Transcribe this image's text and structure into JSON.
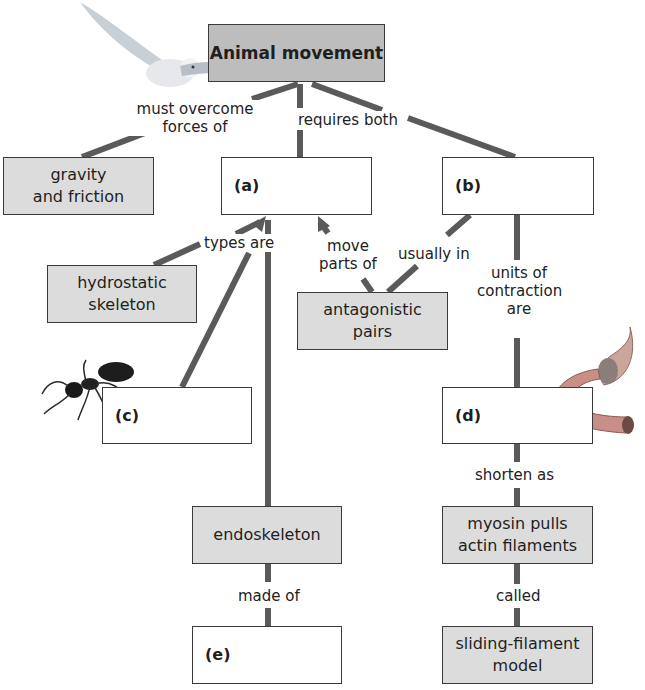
{
  "title": "Animal movement",
  "nodes": {
    "root": "Animal movement",
    "gravity": "gravity and friction",
    "a": "(a)",
    "b": "(b)",
    "hydrostatic": "hydrostatic skeleton",
    "antagonistic": "antagonistic pairs",
    "c": "(c)",
    "d": "(d)",
    "endoskeleton": "endoskeleton",
    "myosin": "myosin pulls actin filaments",
    "e": "(e)",
    "sliding": "sliding-filament model"
  },
  "links": {
    "must_overcome_1": "must overcome",
    "must_overcome_2": "forces of",
    "requires_both": "requires both",
    "types_are": "types are",
    "move_parts_1": "move",
    "move_parts_2": "parts of",
    "usually_in": "usually in",
    "units_1": "units of",
    "units_2": "contraction",
    "units_3": "are",
    "shorten_as": "shorten as",
    "made_of": "made of",
    "called": "called"
  },
  "node_lines": {
    "gravity_1": "gravity",
    "gravity_2": "and friction",
    "hydro_1": "hydrostatic",
    "hydro_2": "skeleton",
    "antag_1": "antagonistic",
    "antag_2": "pairs",
    "myosin_1": "myosin pulls",
    "myosin_2": "actin filaments",
    "sliding_1": "sliding-filament",
    "sliding_2": "model"
  },
  "illustrations": [
    "owl",
    "ant",
    "muscle-fiber"
  ],
  "colors": {
    "root_fill": "#bdbdbd",
    "grey_fill": "#dcdcdc",
    "line": "#555555",
    "border": "#3a3a3a"
  }
}
